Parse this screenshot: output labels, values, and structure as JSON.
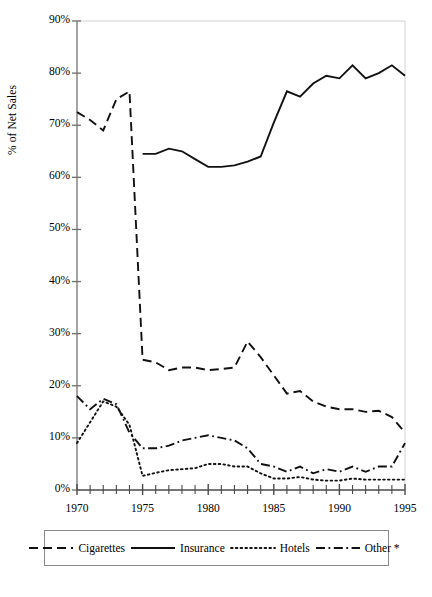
{
  "chart_data": {
    "type": "line",
    "title": "",
    "xlabel": "",
    "ylabel": "% of Net Sales",
    "xlim": [
      1970,
      1995
    ],
    "ylim": [
      0,
      90
    ],
    "ytick_labels": [
      "0%",
      "10%",
      "20%",
      "30%",
      "40%",
      "50%",
      "60%",
      "70%",
      "80%",
      "90%"
    ],
    "ytick_values": [
      0,
      10,
      20,
      30,
      40,
      50,
      60,
      70,
      80,
      90
    ],
    "xtick_labels": [
      "1970",
      "1975",
      "1980",
      "1985",
      "1990",
      "1995"
    ],
    "xtick_values": [
      1970,
      1975,
      1980,
      1985,
      1990,
      1995
    ],
    "minor_xticks": "every year",
    "grid": false,
    "legend_position": "below-axes",
    "x": [
      1970,
      1971,
      1972,
      1973,
      1974,
      1975,
      1976,
      1977,
      1978,
      1979,
      1980,
      1981,
      1982,
      1983,
      1984,
      1985,
      1986,
      1987,
      1988,
      1989,
      1990,
      1991,
      1992,
      1993,
      1994,
      1995
    ],
    "series": [
      {
        "name": "Cigarettes",
        "style": "dashed",
        "values": [
          72.5,
          71.0,
          69.0,
          75.0,
          76.5,
          25.0,
          24.5,
          23.0,
          23.5,
          23.5,
          23.0,
          23.2,
          23.5,
          28.5,
          25.5,
          22.0,
          18.5,
          19.0,
          17.0,
          16.0,
          15.5,
          15.5,
          15.0,
          15.2,
          14.0,
          11.0
        ]
      },
      {
        "name": "Insurance",
        "style": "solid",
        "values": [
          null,
          null,
          null,
          null,
          null,
          64.5,
          64.5,
          65.5,
          65.0,
          63.5,
          62.0,
          62.0,
          62.3,
          63.0,
          64.0,
          70.5,
          76.5,
          75.5,
          78.0,
          79.5,
          79.0,
          81.5,
          79.0,
          80.0,
          81.5,
          79.5
        ]
      },
      {
        "name": "Hotels",
        "style": "dotted",
        "values": [
          9.0,
          13.0,
          17.0,
          16.0,
          12.5,
          2.7,
          3.3,
          3.8,
          4.0,
          4.2,
          5.0,
          5.0,
          4.5,
          4.5,
          3.2,
          2.2,
          2.2,
          2.5,
          2.0,
          1.8,
          1.8,
          2.2,
          2.0,
          2.0,
          2.0,
          2.0
        ]
      },
      {
        "name": "Other *",
        "style": "dashdot",
        "values": [
          18.0,
          15.5,
          17.5,
          16.5,
          11.0,
          8.0,
          8.0,
          8.5,
          9.5,
          10.0,
          10.5,
          10.0,
          9.5,
          8.0,
          5.0,
          4.5,
          3.5,
          4.5,
          3.2,
          4.0,
          3.5,
          4.5,
          3.5,
          4.5,
          4.5,
          9.0
        ]
      }
    ]
  },
  "legend": {
    "entries": [
      {
        "label": "Cigarettes",
        "style": "dashed"
      },
      {
        "label": "Insurance",
        "style": "solid"
      },
      {
        "label": "Hotels",
        "style": "dotted"
      },
      {
        "label": "Other *",
        "style": "dashdot"
      }
    ]
  }
}
